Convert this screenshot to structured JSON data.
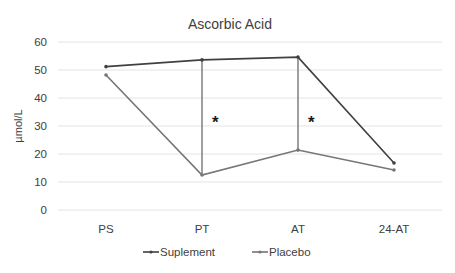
{
  "chart_data": {
    "type": "line",
    "title": "Ascorbic Acid",
    "xlabel": "",
    "ylabel": "µmol/L",
    "categories": [
      "PS",
      "PT",
      "AT",
      "24-AT"
    ],
    "ylim": [
      0,
      60
    ],
    "yticks": [
      0,
      10,
      20,
      30,
      40,
      50,
      60
    ],
    "grid": true,
    "legend": "bottom",
    "series": [
      {
        "name": "Suplement",
        "color": "#404040",
        "values": [
          51.2,
          53.6,
          54.6,
          16.8
        ]
      },
      {
        "name": "Placebo",
        "color": "#767676",
        "values": [
          48.2,
          12.5,
          21.4,
          14.3
        ]
      }
    ],
    "connectors": [
      {
        "category": "PT",
        "color": "#767676"
      },
      {
        "category": "AT",
        "color": "#767676"
      }
    ],
    "annotations": [
      {
        "text": "*",
        "category": "PT",
        "y": 33
      },
      {
        "text": "*",
        "category": "AT",
        "y": 33
      }
    ]
  }
}
